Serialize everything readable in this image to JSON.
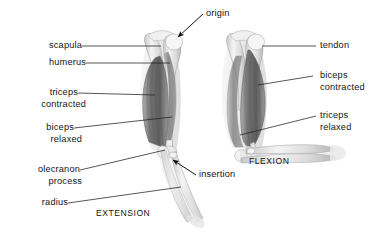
{
  "figure": {
    "background_color": "#ffffff",
    "line_color": "#222222",
    "bone_color": "#e8e8e8",
    "muscle_color": "#8d8d8d",
    "muscle_dark_color": "#6a6a6a"
  },
  "labels": {
    "origin": "origin",
    "insertion": "insertion",
    "scapula": "scapula",
    "humerus": "humerus",
    "triceps_contracted_line1": "triceps",
    "triceps_contracted_line2": "contracted",
    "biceps_relaxed_line1": "biceps",
    "biceps_relaxed_line2": "relaxed",
    "olecranon_line1": "olecranon",
    "olecranon_line2": "process",
    "radius": "radius",
    "tendon": "tendon",
    "biceps_contracted_line1": "biceps",
    "biceps_contracted_line2": "contracted",
    "triceps_relaxed_line1": "triceps",
    "triceps_relaxed_line2": "relaxed"
  },
  "captions": {
    "extension": "EXTENSION",
    "flexion": "FLEXION"
  }
}
